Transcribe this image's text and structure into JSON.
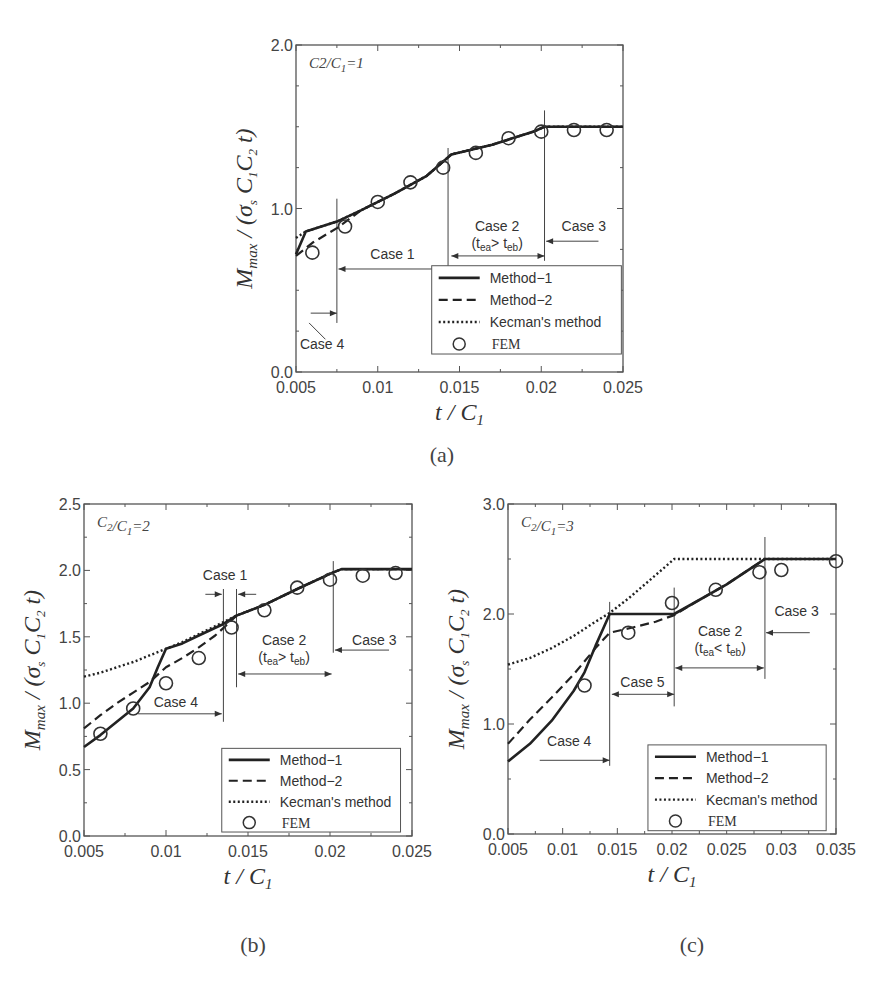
{
  "figure": {
    "captions": [
      "(a)",
      "(b)",
      "(c)"
    ]
  },
  "legend": {
    "items": [
      {
        "label": "Method−1",
        "style": "solid"
      },
      {
        "label": "Method−2",
        "style": "dashed"
      },
      {
        "label": "Kecman's method",
        "style": "dotted"
      },
      {
        "label": "FEM",
        "style": "circle"
      }
    ]
  },
  "chart_data": [
    {
      "id": "a",
      "type": "line",
      "caption": "(a)",
      "annotation": "C2/C1=1",
      "xlabel": "t / C1",
      "ylabel": "Mmax / (σs C1 C2 t)",
      "xlim": [
        0.005,
        0.025
      ],
      "ylim": [
        0.0,
        2.0
      ],
      "xticks": [
        "0.005",
        "0.01",
        "0.015",
        "0.02",
        "0.025"
      ],
      "yticks": [
        "0.0",
        "1.0",
        "2.0"
      ],
      "grid": false,
      "legend_position": "lower right",
      "series": [
        {
          "name": "Method-1",
          "style": "solid",
          "x": [
            0.005,
            0.0056,
            0.0075,
            0.009,
            0.011,
            0.013,
            0.0145,
            0.017,
            0.0195,
            0.0202,
            0.025
          ],
          "y": [
            0.72,
            0.86,
            0.92,
            0.99,
            1.09,
            1.2,
            1.33,
            1.39,
            1.47,
            1.5,
            1.5
          ]
        },
        {
          "name": "Method-2",
          "style": "dashed",
          "x": [
            0.005,
            0.006,
            0.0075,
            0.009,
            0.011,
            0.013,
            0.0145,
            0.017,
            0.0195,
            0.0202,
            0.025
          ],
          "y": [
            0.71,
            0.79,
            0.88,
            0.99,
            1.09,
            1.2,
            1.33,
            1.39,
            1.47,
            1.5,
            1.5
          ]
        },
        {
          "name": "Kecman's method",
          "style": "dotted",
          "x": [
            0.005,
            0.0056,
            0.0075,
            0.009,
            0.011,
            0.013,
            0.0145,
            0.017,
            0.0195,
            0.0202,
            0.025
          ],
          "y": [
            0.82,
            0.86,
            0.92,
            0.99,
            1.09,
            1.2,
            1.33,
            1.39,
            1.47,
            1.5,
            1.5
          ]
        },
        {
          "name": "FEM",
          "style": "circle",
          "x": [
            0.006,
            0.008,
            0.01,
            0.012,
            0.014,
            0.016,
            0.018,
            0.02,
            0.022,
            0.024
          ],
          "y": [
            0.73,
            0.89,
            1.04,
            1.16,
            1.25,
            1.34,
            1.43,
            1.47,
            1.48,
            1.48
          ]
        }
      ],
      "vlines": [
        {
          "x": 0.0075,
          "y0": 0.3,
          "y1": 1.06
        },
        {
          "x": 0.0143,
          "y0": 0.6,
          "y1": 1.37
        },
        {
          "x": 0.0202,
          "y0": 0.68,
          "y1": 1.6
        }
      ],
      "arrows": [
        {
          "x0": 0.0076,
          "x1": 0.0143,
          "y": 0.63,
          "both": true
        },
        {
          "x0": 0.0145,
          "x1": 0.0202,
          "y": 0.71,
          "both": true
        },
        {
          "x0": 0.0235,
          "x1": 0.0203,
          "y": 0.8,
          "both": false
        },
        {
          "x0": 0.0059,
          "x1": 0.0075,
          "y": 0.36,
          "both": false
        }
      ],
      "cases": [
        {
          "label": "Case 1",
          "x": 0.0109,
          "y": 0.69
        },
        {
          "label": "Case 2",
          "x": 0.0173,
          "y": 0.86
        },
        {
          "label": "(t_ea> t_eb)",
          "x": 0.0173,
          "y": 0.76,
          "sub": [
            "t",
            "ea",
            "> t",
            "eb"
          ]
        },
        {
          "label": "Case 3",
          "x": 0.0226,
          "y": 0.86
        },
        {
          "label": "Case 4",
          "x": 0.0066,
          "y": 0.14
        }
      ],
      "leader": {
        "x0": 0.0058,
        "y0": 0.3,
        "x1": 0.0068,
        "y1": 0.2
      },
      "legend_box": {
        "x0": 0.0133,
        "x1": 0.0249,
        "y0": 0.11,
        "y1": 0.65
      }
    },
    {
      "id": "b",
      "type": "line",
      "caption": "(b)",
      "annotation": "C2/C1=2",
      "xlabel": "t / C1",
      "ylabel": "Mmax / (σs C1 C2 t)",
      "xlim": [
        0.005,
        0.025
      ],
      "ylim": [
        0.0,
        2.5
      ],
      "xticks": [
        "0.005",
        "0.01",
        "0.015",
        "0.02",
        "0.025"
      ],
      "yticks": [
        "0.0",
        "0.5",
        "1.0",
        "1.5",
        "2.0",
        "2.5"
      ],
      "grid": false,
      "legend_position": "lower right",
      "series": [
        {
          "name": "Method-1",
          "style": "solid",
          "x": [
            0.005,
            0.006,
            0.007,
            0.008,
            0.009,
            0.0095,
            0.01,
            0.011,
            0.012,
            0.0134,
            0.0143,
            0.016,
            0.018,
            0.0201,
            0.0207,
            0.025
          ],
          "y": [
            0.67,
            0.76,
            0.86,
            0.96,
            1.12,
            1.27,
            1.41,
            1.45,
            1.51,
            1.59,
            1.66,
            1.74,
            1.86,
            1.98,
            2.01,
            2.01
          ]
        },
        {
          "name": "Method-2",
          "style": "dashed",
          "x": [
            0.005,
            0.006,
            0.007,
            0.008,
            0.009,
            0.01,
            0.011,
            0.012,
            0.013,
            0.0138,
            0.0143,
            0.016,
            0.018,
            0.0201,
            0.0207,
            0.025
          ],
          "y": [
            0.81,
            0.91,
            1.0,
            1.08,
            1.16,
            1.27,
            1.34,
            1.42,
            1.51,
            1.6,
            1.66,
            1.74,
            1.86,
            1.98,
            2.01,
            2.01
          ]
        },
        {
          "name": "Kecman's method",
          "style": "dotted",
          "x": [
            0.005,
            0.006,
            0.007,
            0.008,
            0.009,
            0.01,
            0.011,
            0.012,
            0.013,
            0.0143,
            0.016,
            0.018,
            0.0201,
            0.0207,
            0.025
          ],
          "y": [
            1.2,
            1.23,
            1.27,
            1.31,
            1.36,
            1.41,
            1.46,
            1.52,
            1.58,
            1.66,
            1.74,
            1.86,
            1.98,
            2.01,
            2.01
          ]
        },
        {
          "name": "FEM",
          "style": "circle",
          "x": [
            0.006,
            0.008,
            0.01,
            0.012,
            0.014,
            0.016,
            0.018,
            0.02,
            0.022,
            0.024
          ],
          "y": [
            0.77,
            0.96,
            1.15,
            1.34,
            1.57,
            1.7,
            1.87,
            1.93,
            1.96,
            1.98
          ]
        }
      ],
      "vlines": [
        {
          "x": 0.0135,
          "y0": 0.86,
          "y1": 1.86
        },
        {
          "x": 0.0143,
          "y0": 1.12,
          "y1": 1.86
        },
        {
          "x": 0.0202,
          "y0": 1.38,
          "y1": 2.07
        }
      ],
      "arrows": [
        {
          "x0": 0.0083,
          "x1": 0.0134,
          "y": 0.92,
          "both": false
        },
        {
          "x0": 0.0144,
          "x1": 0.0201,
          "y": 1.22,
          "both": true
        },
        {
          "x0": 0.0236,
          "x1": 0.0203,
          "y": 1.4,
          "both": false
        },
        {
          "x0": 0.0124,
          "x1": 0.0134,
          "y": 1.82,
          "both": false
        },
        {
          "x0": 0.0155,
          "x1": 0.0144,
          "y": 1.82,
          "both": false
        }
      ],
      "cases": [
        {
          "label": "Case 1",
          "x": 0.0136,
          "y": 1.93
        },
        {
          "label": "Case 2",
          "x": 0.0172,
          "y": 1.44
        },
        {
          "label": "(t_ea> t_eb)",
          "x": 0.0172,
          "y": 1.31,
          "sub": [
            "t",
            "ea",
            "> t",
            "eb"
          ]
        },
        {
          "label": "Case 3",
          "x": 0.0227,
          "y": 1.44
        },
        {
          "label": "Case 4",
          "x": 0.0106,
          "y": 0.97
        }
      ],
      "legend_box": {
        "x0": 0.0134,
        "x1": 0.0243,
        "y0": 0.03,
        "y1": 0.66
      }
    },
    {
      "id": "c",
      "type": "line",
      "caption": "(c)",
      "annotation": "C2/C1=3",
      "xlabel": "t / C1",
      "ylabel": "Mmax / (σs C1 C2 t)",
      "xlim": [
        0.005,
        0.035
      ],
      "ylim": [
        0.0,
        3.0
      ],
      "xticks": [
        "0.005",
        "0.01",
        "0.015",
        "0.02",
        "0.025",
        "0.03",
        "0.035"
      ],
      "yticks": [
        "0.0",
        "1.0",
        "2.0",
        "3.0"
      ],
      "grid": false,
      "legend_position": "lower right",
      "series": [
        {
          "name": "Method-1",
          "style": "solid",
          "x": [
            0.005,
            0.007,
            0.009,
            0.011,
            0.012,
            0.013,
            0.0143,
            0.0165,
            0.0185,
            0.0202,
            0.022,
            0.025,
            0.0285,
            0.035
          ],
          "y": [
            0.66,
            0.82,
            1.03,
            1.3,
            1.47,
            1.71,
            2.0,
            2.0,
            2.0,
            2.0,
            2.1,
            2.27,
            2.5,
            2.5
          ]
        },
        {
          "name": "Method-2",
          "style": "dashed",
          "x": [
            0.005,
            0.007,
            0.009,
            0.011,
            0.013,
            0.0143,
            0.0165,
            0.0185,
            0.0202,
            0.022,
            0.025,
            0.0285,
            0.035
          ],
          "y": [
            0.82,
            1.04,
            1.24,
            1.45,
            1.69,
            1.83,
            1.88,
            1.93,
            1.99,
            2.1,
            2.27,
            2.5,
            2.5
          ]
        },
        {
          "name": "Kecman's method",
          "style": "dotted",
          "x": [
            0.005,
            0.007,
            0.009,
            0.011,
            0.013,
            0.0143,
            0.016,
            0.018,
            0.0202,
            0.025,
            0.0285,
            0.035
          ],
          "y": [
            1.54,
            1.6,
            1.69,
            1.8,
            1.93,
            2.01,
            2.14,
            2.31,
            2.5,
            2.5,
            2.5,
            2.5
          ]
        },
        {
          "name": "FEM",
          "style": "circle",
          "x": [
            0.012,
            0.016,
            0.02,
            0.024,
            0.028,
            0.03,
            0.035
          ],
          "y": [
            1.35,
            1.83,
            2.1,
            2.22,
            2.38,
            2.4,
            2.48
          ]
        }
      ],
      "vlines": [
        {
          "x": 0.0143,
          "y0": 0.62,
          "y1": 2.11
        },
        {
          "x": 0.0202,
          "y0": 1.16,
          "y1": 2.24
        },
        {
          "x": 0.0285,
          "y0": 1.41,
          "y1": 2.7
        }
      ],
      "arrows": [
        {
          "x0": 0.0079,
          "x1": 0.0143,
          "y": 0.67,
          "both": false
        },
        {
          "x0": 0.0145,
          "x1": 0.0202,
          "y": 1.27,
          "both": true
        },
        {
          "x0": 0.0203,
          "x1": 0.0284,
          "y": 1.51,
          "both": true
        },
        {
          "x0": 0.0326,
          "x1": 0.0286,
          "y": 1.83,
          "both": false
        }
      ],
      "cases": [
        {
          "label": "Case 5",
          "x": 0.0173,
          "y": 1.34
        },
        {
          "label": "Case 2",
          "x": 0.0244,
          "y": 1.8
        },
        {
          "label": "(t_ea< t_eb)",
          "x": 0.0244,
          "y": 1.65,
          "sub": [
            "t",
            "ea",
            "< t",
            "eb"
          ]
        },
        {
          "label": "Case 3",
          "x": 0.0314,
          "y": 1.98
        },
        {
          "label": "Case 4",
          "x": 0.0106,
          "y": 0.8
        }
      ],
      "legend_box": {
        "x0": 0.0178,
        "x1": 0.0341,
        "y0": 0.03,
        "y1": 0.81
      }
    }
  ]
}
